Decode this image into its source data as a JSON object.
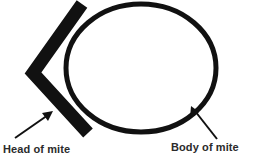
{
  "figure": {
    "type": "anatomy-diagram",
    "subject": "mite",
    "background_color": "#ffffff",
    "ink_color": "#111111",
    "text_color": "#2b2b2b"
  },
  "labels": {
    "head": "Head of mite",
    "body": "Body of mite"
  },
  "shapes": {
    "body_outline": {
      "name": "mite-body-oval",
      "description": "open oval outline representing the body of the mite",
      "center": [
        141,
        68
      ],
      "radius_x": 75,
      "radius_y": 65,
      "stroke_width": 5,
      "fill": "none"
    },
    "head_chevron": {
      "name": "mite-head-chevron",
      "description": "thick black chevron pointing left representing the head of the mite",
      "apex": [
        33,
        73
      ],
      "top_end": [
        82,
        4
      ],
      "bottom_end": [
        88,
        133
      ],
      "stroke_width": 13
    }
  },
  "annotations": [
    {
      "name": "head-arrow",
      "label": "Head of mite",
      "tail": [
        15,
        138
      ],
      "tip": [
        52,
        112
      ]
    },
    {
      "name": "body-arrow",
      "label": "Body of mite",
      "tail": [
        217,
        139
      ],
      "tip": [
        192,
        107
      ]
    }
  ]
}
